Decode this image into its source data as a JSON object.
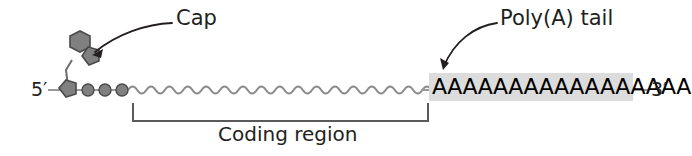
{
  "figure": {
    "background_color": "#ffffff"
  },
  "labels": {
    "cap": "Cap",
    "polya_tail": "Poly(A) tail",
    "coding_region": "Coding region",
    "five_prime": "5′",
    "three_prime": "3′"
  },
  "sequence": {
    "polya_text": "AAAAAAAAAAAAAAAAA",
    "polya_base_count": 17,
    "highlight_color": "#dcdcdc",
    "text_color": "#000000"
  },
  "structure": {
    "cap_hexagon_name": "7-methylguanosine base",
    "cap_pentagon_name": "ribose sugar",
    "terminal_pentagon_name": "first nucleotide sugar",
    "phosphate_circle_count": 3,
    "strand_style": "wavy",
    "strand_color": "#8c8c8c",
    "shape_fill_color": "#808080",
    "shape_stroke_color": "#404040",
    "backbone_color": "#9a9a9a"
  },
  "annotations": {
    "cap_arrow": "curved arrow pointing from Cap label to cap structure",
    "polya_arrow": "curved arrow pointing from Poly(A) tail label to poly-A sequence",
    "coding_bracket": "bracket spanning the coding region"
  }
}
